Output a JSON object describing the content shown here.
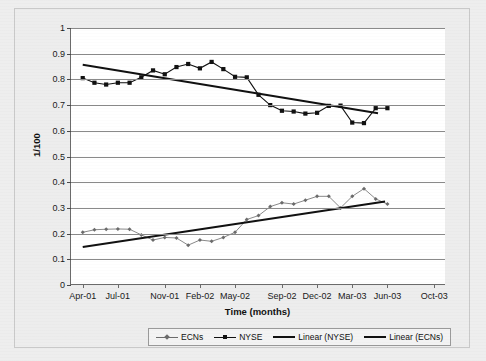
{
  "chart_data": {
    "type": "line",
    "title": "",
    "xlabel": "Time (months)",
    "ylabel": "1/100",
    "ylim": [
      0,
      1
    ],
    "ytick_labels": [
      "0",
      "0.1",
      "0.2",
      "0.3",
      "0.4",
      "0.5",
      "0.6",
      "0.7",
      "0.8",
      "0.9",
      "1"
    ],
    "ytick_values": [
      0,
      0.1,
      0.2,
      0.3,
      0.4,
      0.5,
      0.6,
      0.7,
      0.8,
      0.9,
      1
    ],
    "xtick_labels": [
      "Apr-01",
      "Jul-01",
      "Nov-01",
      "Feb-02",
      "May-02",
      "Sep-02",
      "Dec-02",
      "Mar-03",
      "Jun-03",
      "Oct-03"
    ],
    "xtick_values": [
      0,
      3,
      7,
      10,
      13,
      17,
      20,
      23,
      26,
      30
    ],
    "xlim": [
      -1,
      31
    ],
    "grid": true,
    "legend_position": "bottom",
    "series": [
      {
        "name": "ECNs",
        "marker": "small-diamond",
        "color": "#6b6b6b",
        "x": [
          0,
          1,
          2,
          3,
          4,
          5,
          6,
          7,
          8,
          9,
          10,
          11,
          12,
          13,
          14,
          15,
          16,
          17,
          18,
          19,
          20,
          21,
          22,
          23,
          24,
          25,
          26
        ],
        "values": [
          0.205,
          0.215,
          0.217,
          0.218,
          0.217,
          0.195,
          0.175,
          0.185,
          0.183,
          0.155,
          0.175,
          0.17,
          0.185,
          0.205,
          0.255,
          0.27,
          0.305,
          0.32,
          0.315,
          0.33,
          0.345,
          0.345,
          0.3,
          0.345,
          0.375,
          0.335,
          0.315
        ]
      },
      {
        "name": "NYSE",
        "marker": "filled-square",
        "color": "#111111",
        "x": [
          0,
          1,
          2,
          3,
          4,
          5,
          6,
          7,
          8,
          9,
          10,
          11,
          12,
          13,
          14,
          15,
          16,
          17,
          18,
          19,
          20,
          21,
          22,
          23,
          24,
          25,
          26
        ],
        "values": [
          0.805,
          0.787,
          0.78,
          0.787,
          0.787,
          0.808,
          0.835,
          0.82,
          0.848,
          0.86,
          0.843,
          0.868,
          0.84,
          0.81,
          0.808,
          0.74,
          0.7,
          0.678,
          0.675,
          0.667,
          0.67,
          0.697,
          0.698,
          0.632,
          0.63,
          0.688,
          0.688
        ]
      }
    ],
    "trendlines": [
      {
        "name": "Linear (NYSE)",
        "color": "#111111",
        "x_start": 0,
        "x_end": 25.2,
        "y_start": 0.857,
        "y_end": 0.668
      },
      {
        "name": "Linear (ECNs)",
        "color": "#111111",
        "x_start": 0,
        "x_end": 25.8,
        "y_start": 0.148,
        "y_end": 0.325
      }
    ],
    "legend": [
      {
        "label": "ECNs",
        "style": "line-marker-light"
      },
      {
        "label": "NYSE",
        "style": "line-marker-dark"
      },
      {
        "label": "Linear (NYSE)",
        "style": "thick-line"
      },
      {
        "label": "Linear (ECNs)",
        "style": "thick-line"
      }
    ]
  }
}
